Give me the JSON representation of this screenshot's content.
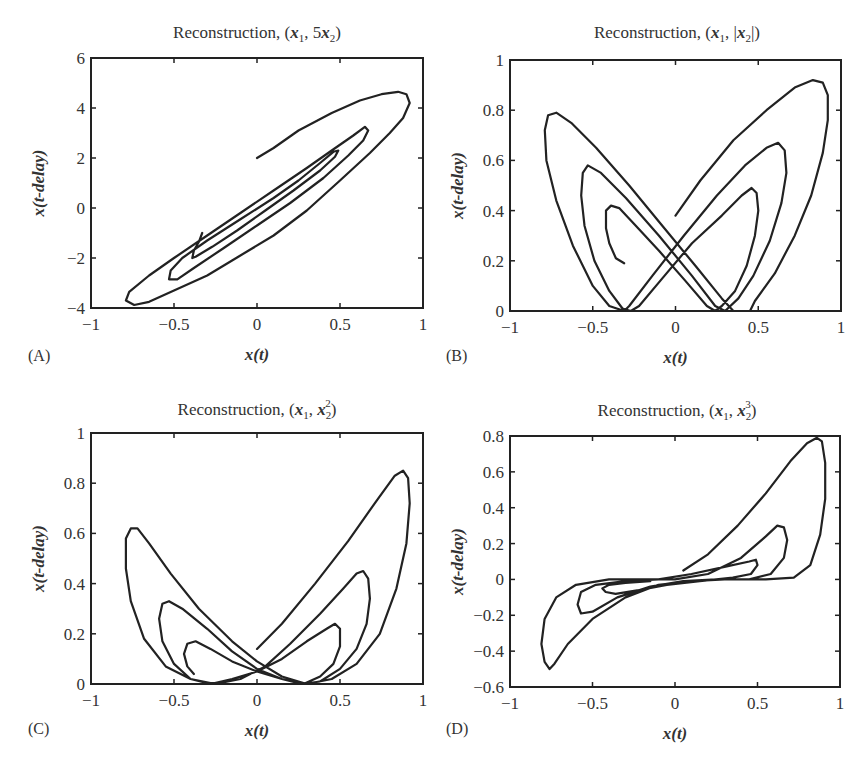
{
  "figure": {
    "panels": [
      {
        "id": "A",
        "label": "(A)",
        "title": "Reconstruction, (x1, 5x2)",
        "title_parts": [
          "Reconstruction, (",
          "x",
          "1",
          ", 5",
          "x",
          "2",
          ")"
        ]
      },
      {
        "id": "B",
        "label": "(B)",
        "title": "Reconstruction, (x1, |x2|)",
        "title_parts": [
          "Reconstruction, (",
          "x",
          "1",
          ", |",
          "x",
          "2",
          "|)"
        ]
      },
      {
        "id": "C",
        "label": "(C)",
        "title": "Reconstruction, (x1, x2^2)",
        "title_parts": [
          "Reconstruction, (",
          "x",
          "1",
          ", ",
          "x",
          "2",
          "2",
          ")"
        ]
      },
      {
        "id": "D",
        "label": "(D)",
        "title": "Reconstruction, (x1, x2^3)",
        "title_parts": [
          "Reconstruction, (",
          "x",
          "1",
          ", ",
          "x",
          "2",
          "3",
          ")"
        ]
      }
    ],
    "xlabel": "x(t)",
    "ylabel": "x(t-delay)"
  },
  "chart_data": [
    {
      "type": "line",
      "panel": "A",
      "title": "Reconstruction, (x1, 5x2)",
      "xlabel": "x(t)",
      "ylabel": "x(t-delay)",
      "xlim": [
        -1,
        1
      ],
      "ylim": [
        -4,
        6
      ],
      "xticks": [
        "-1",
        "-0.5",
        "0",
        "0.5",
        "1"
      ],
      "yticks": [
        "-4",
        "-2",
        "0",
        "2",
        "4",
        "6"
      ],
      "grid": false,
      "legend": null,
      "series": [
        {
          "name": "trajectory",
          "x": [
            0.0,
            0.2,
            0.45,
            0.7,
            0.85,
            0.92,
            0.9,
            0.75,
            0.5,
            0.2,
            -0.1,
            -0.4,
            -0.65,
            -0.78,
            -0.76,
            -0.6,
            -0.3,
            0.0,
            0.3,
            0.55,
            0.67,
            0.62,
            0.4,
            0.1,
            -0.2,
            -0.45,
            -0.55,
            -0.45,
            -0.2,
            0.1,
            0.35,
            0.49,
            0.45,
            0.25,
            0.0,
            -0.25,
            -0.4,
            -0.38,
            -0.33
          ],
          "y": [
            2.0,
            2.8,
            3.6,
            4.3,
            4.65,
            4.3,
            3.5,
            2.4,
            1.0,
            -0.4,
            -1.7,
            -2.9,
            -3.7,
            -3.85,
            -3.5,
            -2.5,
            -1.2,
            0.0,
            1.3,
            2.5,
            3.2,
            3.3,
            2.7,
            1.6,
            0.3,
            -1.4,
            -2.6,
            -2.9,
            -2.4,
            -1.6,
            -0.5,
            0.6,
            2.3,
            2.3,
            1.8,
            0.5,
            -1.2,
            -2.0,
            -1.0
          ]
        }
      ]
    },
    {
      "type": "line",
      "panel": "B",
      "title": "Reconstruction, (x1, |x2|)",
      "xlabel": "x(t)",
      "ylabel": "x(t-delay)",
      "xlim": [
        -1,
        1
      ],
      "ylim": [
        0,
        1
      ],
      "xticks": [
        "-1",
        "-0.5",
        "0",
        "0.5",
        "1"
      ],
      "yticks": [
        "0",
        "0.2",
        "0.4",
        "0.6",
        "0.8",
        "1"
      ],
      "grid": false,
      "legend": null,
      "series": [
        {
          "name": "trajectory",
          "peaks_right": [
            {
              "x": 0.87,
              "y": 0.92
            },
            {
              "x": 0.63,
              "y": 0.67
            },
            {
              "x": 0.47,
              "y": 0.49
            }
          ],
          "peaks_left": [
            {
              "x": -0.73,
              "y": 0.79
            },
            {
              "x": -0.55,
              "y": 0.58
            },
            {
              "x": -0.4,
              "y": 0.42
            }
          ],
          "zero_crossings_x": [
            -0.31,
            -0.27,
            -0.22,
            0.19,
            0.24,
            0.3,
            0.35
          ],
          "start": {
            "x": 0.0,
            "y": 0.38
          },
          "end": {
            "x": -0.31,
            "y": 0.19
          }
        }
      ]
    },
    {
      "type": "line",
      "panel": "C",
      "title": "Reconstruction, (x1, x2^2)",
      "xlabel": "x(t)",
      "ylabel": "x(t-delay)",
      "xlim": [
        -1,
        1
      ],
      "ylim": [
        0,
        1
      ],
      "xticks": [
        "-1",
        "-0.5",
        "0",
        "0.5",
        "1"
      ],
      "yticks": [
        "0",
        "0.2",
        "0.4",
        "0.6",
        "0.8",
        "1"
      ],
      "grid": false,
      "legend": null,
      "series": [
        {
          "name": "trajectory",
          "peaks_right": [
            {
              "x": 0.86,
              "y": 0.85
            },
            {
              "x": 0.63,
              "y": 0.45
            },
            {
              "x": 0.47,
              "y": 0.24
            }
          ],
          "peaks_left": [
            {
              "x": -0.73,
              "y": 0.63
            },
            {
              "x": -0.55,
              "y": 0.33
            },
            {
              "x": -0.4,
              "y": 0.17
            }
          ],
          "start": {
            "x": 0.0,
            "y": 0.14
          }
        }
      ]
    },
    {
      "type": "line",
      "panel": "D",
      "title": "Reconstruction, (x1, x2^3)",
      "xlabel": "x(t)",
      "ylabel": "x(t-delay)",
      "xlim": [
        -1,
        1
      ],
      "ylim": [
        -0.6,
        0.8
      ],
      "xticks": [
        "-1",
        "-0.5",
        "0",
        "0.5",
        "1"
      ],
      "yticks": [
        "-0.6",
        "-0.4",
        "-0.2",
        "0",
        "0.2",
        "0.4",
        "0.6",
        "0.8"
      ],
      "grid": false,
      "legend": null,
      "series": [
        {
          "name": "trajectory",
          "max": {
            "x": 0.86,
            "y": 0.79
          },
          "min": {
            "x": -0.73,
            "y": -0.5
          },
          "inner_right": [
            {
              "x": 0.63,
              "y": 0.3
            },
            {
              "x": 0.49,
              "y": 0.11
            }
          ],
          "inner_left": [
            {
              "x": -0.55,
              "y": -0.19
            },
            {
              "x": -0.4,
              "y": -0.08
            }
          ],
          "start": {
            "x": 0.05,
            "y": 0.05
          }
        }
      ]
    }
  ]
}
